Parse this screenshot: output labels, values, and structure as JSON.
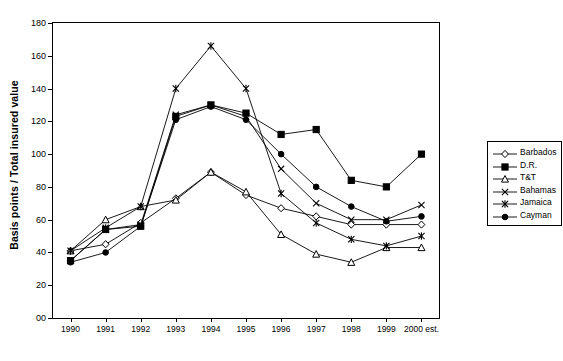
{
  "chart_data": {
    "type": "line",
    "title": "",
    "xlabel": "",
    "ylabel": "Basis points / Total insured value",
    "categories": [
      "1990",
      "1991",
      "1992",
      "1993",
      "1994",
      "1995",
      "1996",
      "1997",
      "1998",
      "1999",
      "2000 est."
    ],
    "ylim": [
      0,
      180
    ],
    "ytick_labels": [
      "00",
      "20",
      "40",
      "60",
      "80",
      "100",
      "120",
      "140",
      "160",
      "180"
    ],
    "ytick_values": [
      0,
      20,
      40,
      60,
      80,
      100,
      120,
      140,
      160,
      180
    ],
    "grid": false,
    "legend_position": "right",
    "series": [
      {
        "name": "Barbados",
        "marker": "diamond",
        "values": [
          41,
          45,
          58,
          73,
          89,
          75,
          67,
          62,
          57,
          57,
          57
        ]
      },
      {
        "name": "D.R.",
        "marker": "square-filled",
        "values": [
          35,
          54,
          56,
          123,
          130,
          125,
          112,
          115,
          84,
          80,
          100
        ]
      },
      {
        "name": "T&T",
        "marker": "triangle",
        "values": [
          41,
          60,
          68,
          72,
          89,
          77,
          51,
          39,
          34,
          43,
          43
        ]
      },
      {
        "name": "Bahamas",
        "marker": "cross",
        "values": [
          35,
          54,
          57,
          124,
          130,
          123,
          91,
          70,
          60,
          60,
          69
        ]
      },
      {
        "name": "Jamaica",
        "marker": "star",
        "values": [
          41,
          55,
          68,
          140,
          166,
          140,
          76,
          58,
          48,
          44,
          50
        ]
      },
      {
        "name": "Cayman",
        "marker": "circle-filled",
        "values": [
          34,
          40,
          56,
          121,
          129,
          121,
          100,
          80,
          68,
          59,
          62
        ]
      }
    ]
  },
  "legend": {
    "items": [
      {
        "label": "Barbados"
      },
      {
        "label": "D.R."
      },
      {
        "label": "T&T"
      },
      {
        "label": "Bahamas"
      },
      {
        "label": "Jamaica"
      },
      {
        "label": "Cayman"
      }
    ]
  },
  "colors": {
    "line": "#000000",
    "frame": "#000000",
    "background": "#ffffff"
  }
}
